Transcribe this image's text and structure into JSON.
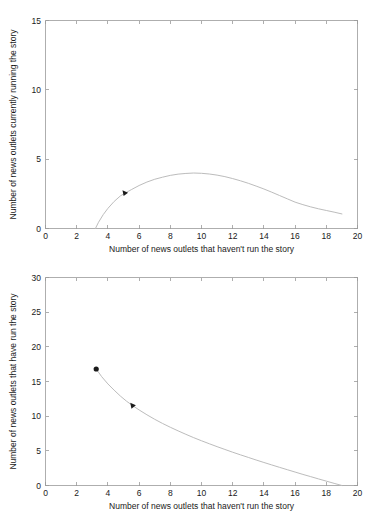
{
  "figure": {
    "background_color": "#ffffff",
    "curve_color": "#bcbcbc",
    "axis_color": "#9a9a9a",
    "text_color": "#1a1a1a"
  },
  "chart_data": [
    {
      "id": "top",
      "type": "line",
      "title": "",
      "xlabel": "Number of news outlets that haven't run the story",
      "ylabel": "Number of news outlets currently running the story",
      "xlim": [
        0,
        20
      ],
      "ylim": [
        0,
        15
      ],
      "xticks": [
        0,
        2,
        4,
        6,
        8,
        10,
        12,
        14,
        16,
        18,
        20
      ],
      "xticklabels": [
        "0",
        "2",
        "4",
        "6",
        "8",
        "10",
        "12",
        "14",
        "16",
        "18",
        "20"
      ],
      "yticks": [
        0,
        5,
        10,
        15
      ],
      "yticklabels": [
        "0",
        "5",
        "10",
        "15"
      ],
      "grid": false,
      "legend": null,
      "series": [
        {
          "name": "trajectory",
          "x": [
            3.2,
            3.4,
            3.7,
            4.0,
            4.4,
            4.8,
            5.1,
            5.5,
            6.0,
            6.5,
            7.0,
            7.5,
            8.0,
            8.5,
            9.0,
            9.5,
            10.0,
            10.5,
            11.0,
            11.5,
            12.0,
            12.5,
            13.0,
            13.5,
            14.0,
            14.5,
            15.0,
            15.5,
            16.0,
            16.5,
            17.0,
            17.5,
            18.0,
            18.5,
            19.0
          ],
          "y": [
            0.0,
            0.45,
            1.0,
            1.45,
            1.95,
            2.35,
            2.55,
            2.8,
            3.1,
            3.35,
            3.55,
            3.7,
            3.83,
            3.92,
            3.97,
            4.0,
            3.98,
            3.93,
            3.85,
            3.74,
            3.6,
            3.44,
            3.26,
            3.06,
            2.85,
            2.62,
            2.38,
            2.14,
            1.9,
            1.72,
            1.56,
            1.42,
            1.3,
            1.18,
            1.05
          ]
        }
      ],
      "markers": [
        {
          "name": "arrow-marker",
          "shape": "triangle-right",
          "x": 5.1,
          "y": 2.55
        }
      ]
    },
    {
      "id": "bottom",
      "type": "line",
      "title": "",
      "xlabel": "Number of news outlets that haven't run the story",
      "ylabel": "Number of news outlets that have run the story",
      "xlim": [
        0,
        20
      ],
      "ylim": [
        0,
        30
      ],
      "xticks": [
        0,
        2,
        4,
        6,
        8,
        10,
        12,
        14,
        16,
        18,
        20
      ],
      "xticklabels": [
        "0",
        "2",
        "4",
        "6",
        "8",
        "10",
        "12",
        "14",
        "16",
        "18",
        "20"
      ],
      "yticks": [
        0,
        5,
        10,
        15,
        20,
        25,
        30
      ],
      "yticklabels": [
        "0",
        "5",
        "10",
        "15",
        "20",
        "25",
        "30"
      ],
      "grid": false,
      "legend": null,
      "series": [
        {
          "name": "trajectory",
          "x": [
            3.25,
            3.6,
            4.0,
            4.4,
            4.8,
            5.2,
            5.6,
            6.0,
            6.5,
            7.0,
            7.5,
            8.0,
            8.5,
            9.0,
            9.5,
            10.0,
            10.5,
            11.0,
            11.5,
            12.0,
            12.5,
            13.0,
            13.5,
            14.0,
            14.5,
            15.0,
            15.5,
            16.0,
            16.5,
            17.0,
            17.5,
            18.0,
            18.5,
            19.0
          ],
          "y": [
            16.8,
            15.7,
            14.65,
            13.75,
            12.9,
            12.15,
            11.5,
            10.9,
            10.2,
            9.55,
            8.95,
            8.4,
            7.88,
            7.38,
            6.9,
            6.45,
            6.02,
            5.6,
            5.2,
            4.8,
            4.42,
            4.05,
            3.68,
            3.32,
            2.97,
            2.62,
            2.28,
            1.94,
            1.6,
            1.28,
            0.95,
            0.63,
            0.31,
            0.0
          ]
        }
      ],
      "markers": [
        {
          "name": "start-dot-marker",
          "shape": "circle",
          "x": 3.25,
          "y": 16.8
        },
        {
          "name": "arrow-marker",
          "shape": "triangle-right",
          "x": 5.6,
          "y": 11.5
        }
      ]
    }
  ]
}
